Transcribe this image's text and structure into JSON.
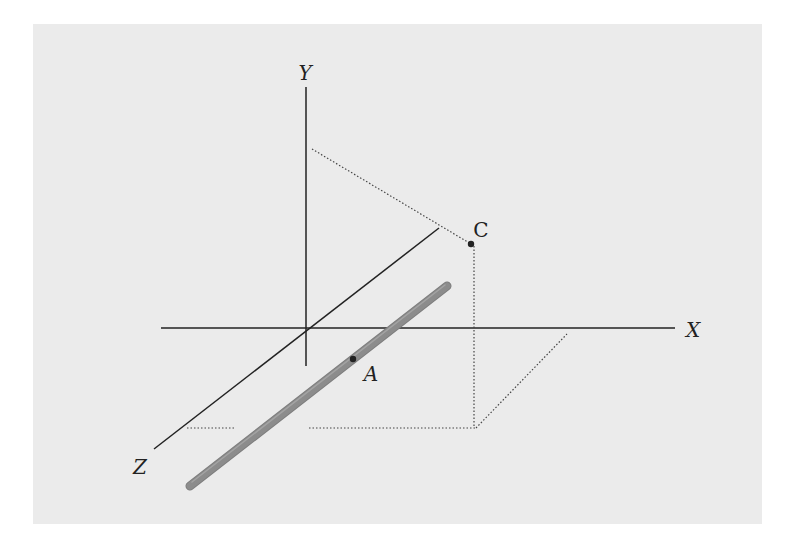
{
  "diagram": {
    "background_color": "#ebebeb",
    "axes": {
      "x_label": "X",
      "y_label": "Y",
      "z_label": "Z",
      "origin": [
        306,
        329
      ]
    },
    "points": [
      {
        "label": "C",
        "x": 471,
        "y": 244
      },
      {
        "label": "A",
        "x": 353,
        "y": 359
      }
    ],
    "rod": {
      "from": [
        190,
        486
      ],
      "to": [
        447,
        286
      ],
      "color": "#8c8c8c"
    },
    "colors": {
      "axis": "#222222",
      "dotted": "#444444",
      "point": "#222222"
    }
  }
}
